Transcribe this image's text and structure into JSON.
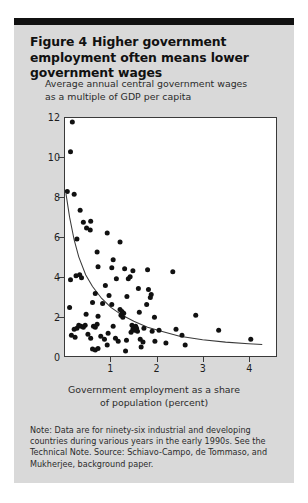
{
  "figure": {
    "number_label": "Figure 4",
    "title": "Higher government employment often means lower government wages",
    "subtitle_line1": "Average annual central government wages",
    "subtitle_line2": "as a multiple of GDP per capita",
    "note": "Note: Data are for ninety-six industrial and developing countries during various years in the early 1990s. See the Technical Note. Source: Schiavo-Campo, de Tommaso, and Mukherjee, background paper.",
    "panel_color": "#d9d9d9",
    "rule_color": "#111111",
    "marker_color": "#111111",
    "axis_color": "#3a3a3a"
  },
  "chart_data": {
    "type": "scatter",
    "title": "Higher government employment often means lower government wages",
    "subtitle": "Average annual central government wages as a multiple of GDP per capita",
    "xlabel": "Government employment as a share of population (percent)",
    "ylabel": "Average annual central government wages as a multiple of GDP per capita",
    "xlim": [
      0,
      4.6
    ],
    "ylim": [
      0,
      12
    ],
    "xticks": [
      1,
      2,
      3,
      4
    ],
    "xtick_labels": [
      "1",
      "2",
      "3",
      "4"
    ],
    "yticks": [
      0,
      2,
      4,
      6,
      8,
      10,
      12
    ],
    "ytick_labels": [
      "0",
      "2",
      "4",
      "6",
      "8",
      "10",
      "12"
    ],
    "grid": false,
    "legend": false,
    "n_observations": 96,
    "series": [
      {
        "name": "Countries",
        "marker": "filled-circle",
        "points": [
          [
            0.16,
            11.8
          ],
          [
            0.12,
            10.3
          ],
          [
            0.05,
            8.3
          ],
          [
            0.2,
            8.15
          ],
          [
            0.33,
            7.35
          ],
          [
            0.4,
            6.75
          ],
          [
            0.56,
            6.8
          ],
          [
            0.47,
            6.45
          ],
          [
            0.55,
            6.35
          ],
          [
            0.26,
            5.9
          ],
          [
            0.92,
            6.2
          ],
          [
            1.2,
            5.75
          ],
          [
            0.7,
            5.25
          ],
          [
            1.05,
            4.85
          ],
          [
            0.72,
            4.5
          ],
          [
            1.02,
            4.45
          ],
          [
            1.3,
            4.4
          ],
          [
            1.48,
            4.3
          ],
          [
            1.8,
            4.35
          ],
          [
            2.35,
            4.25
          ],
          [
            0.24,
            4.05
          ],
          [
            0.32,
            4.1
          ],
          [
            0.36,
            3.95
          ],
          [
            0.12,
            3.85
          ],
          [
            1.12,
            3.9
          ],
          [
            1.38,
            3.9
          ],
          [
            1.42,
            4.0
          ],
          [
            0.88,
            3.55
          ],
          [
            1.6,
            3.4
          ],
          [
            1.82,
            3.35
          ],
          [
            1.88,
            3.1
          ],
          [
            0.66,
            3.15
          ],
          [
            0.96,
            3.05
          ],
          [
            1.35,
            3.0
          ],
          [
            1.86,
            2.95
          ],
          [
            0.6,
            2.7
          ],
          [
            0.82,
            2.65
          ],
          [
            1.02,
            2.6
          ],
          [
            1.78,
            2.6
          ],
          [
            0.1,
            2.45
          ],
          [
            1.2,
            2.35
          ],
          [
            1.24,
            2.25
          ],
          [
            1.28,
            2.15
          ],
          [
            1.22,
            2.05
          ],
          [
            1.26,
            1.95
          ],
          [
            0.46,
            2.1
          ],
          [
            0.72,
            2.0
          ],
          [
            1.62,
            2.2
          ],
          [
            1.95,
            1.95
          ],
          [
            2.85,
            2.05
          ],
          [
            0.3,
            1.55
          ],
          [
            0.35,
            1.5
          ],
          [
            0.4,
            1.45
          ],
          [
            0.44,
            1.55
          ],
          [
            0.26,
            1.4
          ],
          [
            0.2,
            1.35
          ],
          [
            0.62,
            1.5
          ],
          [
            0.66,
            1.45
          ],
          [
            0.7,
            1.6
          ],
          [
            1.05,
            1.5
          ],
          [
            1.46,
            1.55
          ],
          [
            1.5,
            1.45
          ],
          [
            1.54,
            1.5
          ],
          [
            1.48,
            1.35
          ],
          [
            1.52,
            1.3
          ],
          [
            1.56,
            1.4
          ],
          [
            1.58,
            1.25
          ],
          [
            1.44,
            1.2
          ],
          [
            1.72,
            1.4
          ],
          [
            1.9,
            1.25
          ],
          [
            2.05,
            1.3
          ],
          [
            2.42,
            1.35
          ],
          [
            2.55,
            1.05
          ],
          [
            3.35,
            1.3
          ],
          [
            4.05,
            0.85
          ],
          [
            0.14,
            1.05
          ],
          [
            0.22,
            0.95
          ],
          [
            0.5,
            1.1
          ],
          [
            0.56,
            0.9
          ],
          [
            0.78,
            1.0
          ],
          [
            0.86,
            0.85
          ],
          [
            0.94,
            1.15
          ],
          [
            1.1,
            0.9
          ],
          [
            1.16,
            0.75
          ],
          [
            1.34,
            0.8
          ],
          [
            1.64,
            0.85
          ],
          [
            1.7,
            0.7
          ],
          [
            1.96,
            0.75
          ],
          [
            2.2,
            0.65
          ],
          [
            0.6,
            0.35
          ],
          [
            0.66,
            0.3
          ],
          [
            0.72,
            0.38
          ],
          [
            1.32,
            0.25
          ],
          [
            1.66,
            0.45
          ],
          [
            0.92,
            0.55
          ],
          [
            2.62,
            0.55
          ]
        ]
      }
    ],
    "fit_curve": {
      "name": "fitted trend",
      "style": "solid",
      "color": "#3a3a3a",
      "points": [
        [
          0.02,
          8.2
        ],
        [
          0.1,
          7.0
        ],
        [
          0.2,
          5.85
        ],
        [
          0.3,
          5.0
        ],
        [
          0.45,
          4.1
        ],
        [
          0.6,
          3.5
        ],
        [
          0.8,
          2.9
        ],
        [
          1.0,
          2.45
        ],
        [
          1.25,
          2.05
        ],
        [
          1.5,
          1.75
        ],
        [
          1.8,
          1.45
        ],
        [
          2.1,
          1.25
        ],
        [
          2.5,
          1.0
        ],
        [
          3.0,
          0.82
        ],
        [
          3.5,
          0.7
        ],
        [
          4.0,
          0.62
        ],
        [
          4.3,
          0.58
        ]
      ]
    }
  }
}
